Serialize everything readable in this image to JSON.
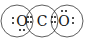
{
  "diagram": {
    "atoms": [
      {
        "symbol": "O",
        "cx": 17,
        "cy": 21
      },
      {
        "symbol": "C",
        "cx": 42,
        "cy": 21
      },
      {
        "symbol": "O",
        "cx": 67,
        "cy": 21
      }
    ],
    "circle_radius": 16,
    "colors": {
      "stroke": "#333333",
      "text": "#111111",
      "background": "#ffffff"
    }
  }
}
